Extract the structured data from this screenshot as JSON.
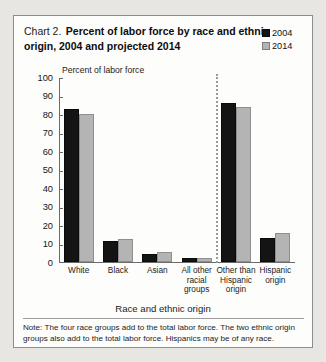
{
  "figure": {
    "title_prefix": "Chart 2.",
    "title_main": "Percent of labor force by race and ethnic origin, 2004 and projected 2014",
    "y_axis_note": "Percent of labor force",
    "x_axis_title": "Race and ethnic origin",
    "note": "Note: The four race groups add to the total labor force. The two ethnic origin groups also add to the total labor force. Hispanics may be of any race."
  },
  "legend": {
    "items": [
      {
        "label": "2004",
        "color": "#141414"
      },
      {
        "label": "2014",
        "color": "#b4b4b4"
      }
    ]
  },
  "y_ticks": [
    "100",
    "90",
    "80",
    "70",
    "60",
    "50",
    "40",
    "30",
    "20",
    "10",
    "0"
  ],
  "categories": [
    {
      "label": "White",
      "lines": [
        "White"
      ]
    },
    {
      "label": "Black",
      "lines": [
        "Black"
      ]
    },
    {
      "label": "Asian",
      "lines": [
        "Asian"
      ]
    },
    {
      "label": "All other racial groups",
      "lines": [
        "All other",
        "racial",
        "groups"
      ]
    },
    {
      "label": "Other than Hispanic origin",
      "lines": [
        "Other than",
        "Hispanic",
        "origin"
      ]
    },
    {
      "label": "Hispanic origin",
      "lines": [
        "Hispanic",
        "origin"
      ]
    }
  ],
  "chart_data": {
    "type": "bar",
    "title": "Chart 2. Percent of labor force by race and ethnic origin, 2004 and projected 2014",
    "xlabel": "Race and ethnic origin",
    "ylabel": "Percent of labor force",
    "ylim": [
      0,
      100
    ],
    "ytick_step": 10,
    "grid": false,
    "legend_position": "top-right",
    "categories": [
      "White",
      "Black",
      "Asian",
      "All other racial groups",
      "Other than Hispanic origin",
      "Hispanic origin"
    ],
    "series": [
      {
        "name": "2004",
        "color": "#141414",
        "values": [
          82.5,
          11.3,
          4.3,
          2.0,
          86.0,
          13.0
        ]
      },
      {
        "name": "2014",
        "color": "#b4b4b4",
        "values": [
          80.0,
          12.4,
          5.4,
          2.2,
          84.0,
          15.5
        ]
      }
    ],
    "annotations": [
      "Dotted vertical divider separates the four race groups from the two ethnic origin groups."
    ]
  }
}
